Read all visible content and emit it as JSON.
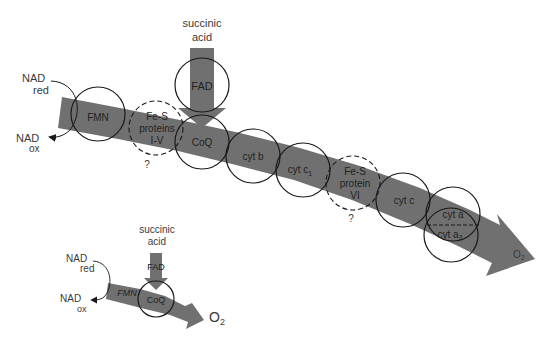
{
  "main_diagram": {
    "input_left": {
      "top": "NAD",
      "top_sub": "red",
      "bottom": "NAD",
      "bottom_sub": "ox"
    },
    "side_input": {
      "line1": "succinic",
      "line2": "acid",
      "carrier": "FAD"
    },
    "carriers": [
      {
        "id": "fmn",
        "lines": [
          "FMN"
        ]
      },
      {
        "id": "fes-1-5",
        "lines": [
          "Fe-S",
          "proteins",
          "I-V"
        ],
        "uncertain": "?"
      },
      {
        "id": "coq",
        "lines": [
          "CoQ"
        ]
      },
      {
        "id": "cyt-b",
        "lines": [
          "cyt b"
        ]
      },
      {
        "id": "cyt-c1",
        "lines": [
          "cyt c",
          "1"
        ]
      },
      {
        "id": "fes-6",
        "lines": [
          "Fe-S",
          "protein",
          "VI"
        ],
        "uncertain": "?"
      },
      {
        "id": "cyt-c",
        "lines": [
          "cyt c"
        ]
      },
      {
        "id": "cyt-a-a3",
        "lines": [
          "cyt a",
          "cyt a",
          "3"
        ]
      }
    ],
    "output": {
      "label": "O",
      "sub": "2"
    }
  },
  "inset_diagram": {
    "input_left": {
      "top": "NAD",
      "top_sub": "red",
      "bottom": "NAD",
      "bottom_sub": "ox"
    },
    "side_input": {
      "line1": "succinic",
      "line2": "acid",
      "carrier": "FAD"
    },
    "carriers": [
      {
        "id": "fmn",
        "lines": [
          "FMN"
        ]
      },
      {
        "id": "coq",
        "lines": [
          "CoQ"
        ]
      }
    ],
    "output": {
      "label": "O",
      "sub": "2"
    }
  },
  "colors": {
    "band": "#707070",
    "ring": "#1a1a1a",
    "text": "#3a3a3a"
  }
}
